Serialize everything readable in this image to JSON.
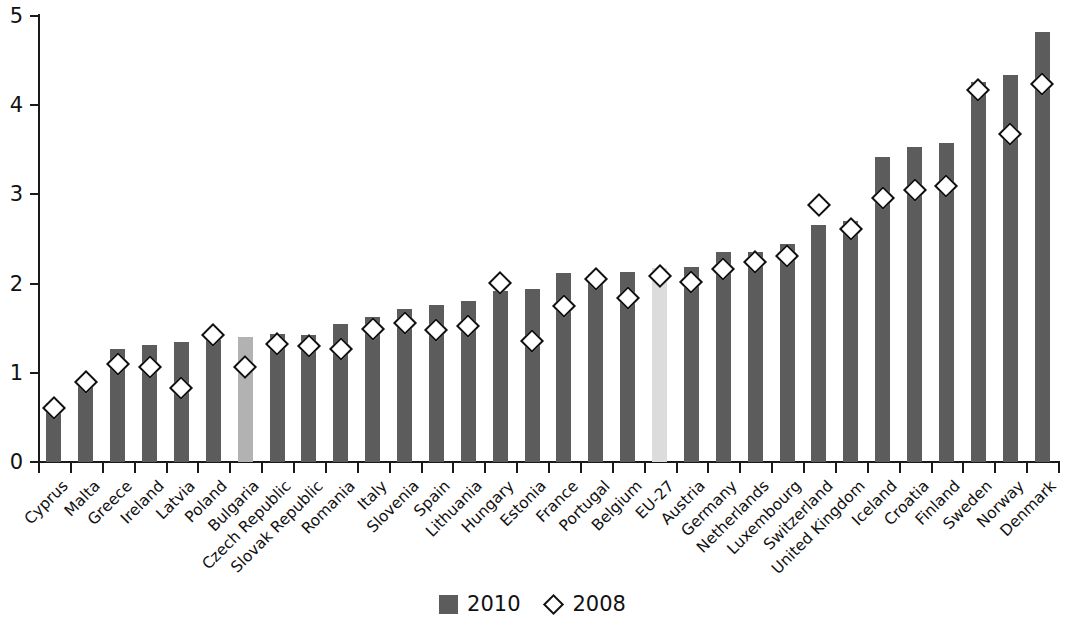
{
  "chart_data": {
    "type": "bar",
    "title": "",
    "subtitle": "",
    "xlabel": "",
    "ylabel": "",
    "ylim": [
      0,
      5
    ],
    "yticks": [
      0,
      1,
      2,
      3,
      4,
      5
    ],
    "ytick_labels": [
      "0",
      "1",
      "2",
      "3",
      "4",
      "5"
    ],
    "grid": false,
    "legend_position": "bottom-center",
    "categories": [
      "Cyprus",
      "Malta",
      "Greece",
      "Ireland",
      "Latvia",
      "Poland",
      "Bulgaria",
      "Czech Republic",
      "Slovak Republic",
      "Romania",
      "Italy",
      "Slovenia",
      "Spain",
      "Lithuania",
      "Hungary",
      "Estonia",
      "France",
      "Portugal",
      "Belgium",
      "EU-27",
      "Austria",
      "Germany",
      "Netherlands",
      "Luxembourg",
      "Switzerland",
      "United Kingdom",
      "Iceland",
      "Croatia",
      "Finland",
      "Sweden",
      "Norway",
      "Denmark"
    ],
    "series": [
      {
        "name": "2010",
        "marker": "bar",
        "color": "#5c5c5c",
        "values": [
          0.66,
          0.88,
          1.27,
          1.31,
          1.34,
          1.37,
          1.4,
          1.43,
          1.42,
          1.55,
          1.63,
          1.72,
          1.76,
          1.8,
          1.92,
          1.94,
          2.12,
          2.11,
          2.13,
          2.17,
          2.19,
          2.35,
          2.36,
          2.44,
          2.66,
          2.7,
          3.42,
          3.53,
          3.58,
          4.26,
          4.34,
          4.82
        ]
      },
      {
        "name": "2008",
        "marker": "diamond",
        "color": "#ffffff",
        "values": [
          0.7,
          0.99,
          1.19,
          1.16,
          0.92,
          1.52,
          1.16,
          1.42,
          1.4,
          1.36,
          1.59,
          1.65,
          1.58,
          1.62,
          2.1,
          1.45,
          1.84,
          2.15,
          1.93,
          2.18,
          2.11,
          2.26,
          2.34,
          2.41,
          2.98,
          2.71,
          3.05,
          3.15,
          3.19,
          4.27,
          3.77,
          4.33
        ]
      }
    ],
    "highlighted_bars": {
      "Bulgaria": "#b2b2b2",
      "EU-27": "#dcdcdc"
    }
  },
  "legend": {
    "items": [
      {
        "label": "2010",
        "icon": "bar-swatch"
      },
      {
        "label": "2008",
        "icon": "diamond-swatch"
      }
    ]
  }
}
